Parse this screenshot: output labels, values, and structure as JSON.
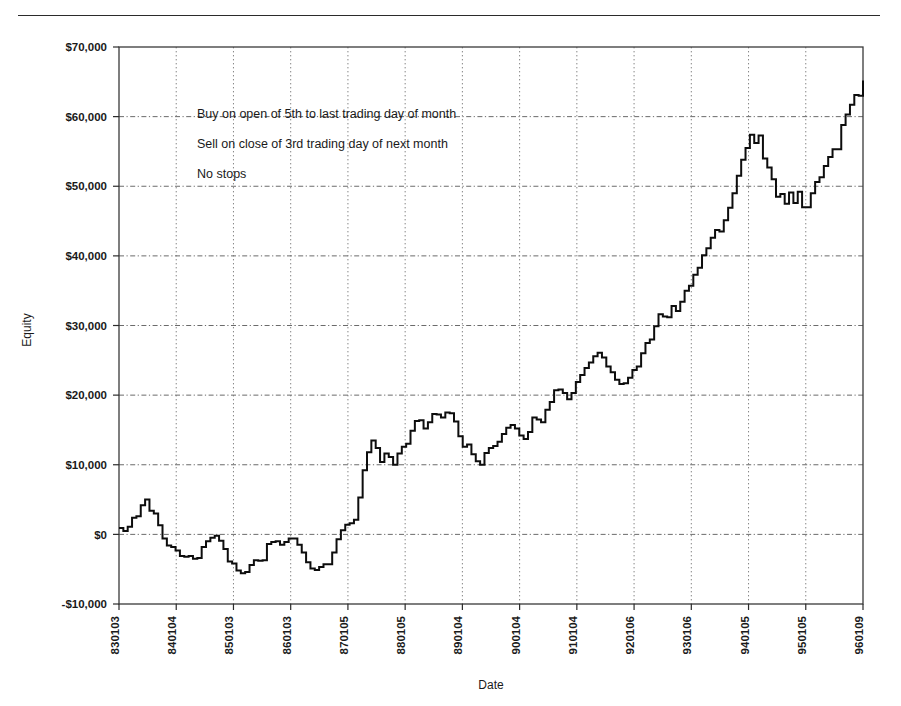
{
  "figure": {
    "kind": "equity-curve-chart"
  },
  "chart_data": {
    "type": "line",
    "title": "",
    "xlabel": "Date",
    "ylabel": "Equity",
    "grid": true,
    "legend": "none",
    "ylim": [
      -10000,
      70000
    ],
    "ytick_values": [
      70000,
      60000,
      50000,
      40000,
      30000,
      20000,
      10000,
      0,
      -10000
    ],
    "ytick_labels": [
      "$70,000",
      "$60,000",
      "$50,000",
      "$40,000",
      "$30,000",
      "$20,000",
      "$10,000",
      "$0",
      "-$10,000"
    ],
    "xtick_labels": [
      "830103",
      "840104",
      "850103",
      "860103",
      "870105",
      "880105",
      "890104",
      "900104",
      "910104",
      "920106",
      "930106",
      "940105",
      "950105",
      "960109"
    ],
    "xlim_labels": [
      "830103",
      "960109"
    ],
    "annotations": [
      "Buy on open of 5th to last trading day of month",
      "Sell on close of 3rd trading day of next month",
      "No stops"
    ],
    "series_name": "Equity",
    "line_color": "#0d0d0d",
    "step_style": "post",
    "x_index": [
      0,
      1,
      2,
      3,
      4,
      5,
      6,
      7,
      8,
      9,
      10,
      11,
      12,
      13,
      14,
      15,
      16,
      17,
      18,
      19,
      20,
      21,
      22,
      23,
      24,
      25,
      26,
      27,
      28,
      29,
      30,
      31,
      32,
      33,
      34,
      35,
      36,
      37,
      38,
      39,
      40,
      41,
      42,
      43,
      44,
      45,
      46,
      47,
      48,
      49,
      50,
      51,
      52,
      53,
      54,
      55,
      56,
      57,
      58,
      59,
      60,
      61,
      62,
      63,
      64,
      65,
      66,
      67,
      68,
      69,
      70,
      71,
      72,
      73,
      74,
      75,
      76,
      77,
      78,
      79,
      80,
      81,
      82,
      83,
      84,
      85,
      86,
      87,
      88,
      89,
      90,
      91,
      92,
      93,
      94,
      95,
      96,
      97,
      98,
      99,
      100,
      101,
      102,
      103,
      104,
      105,
      106,
      107,
      108,
      109,
      110,
      111,
      112,
      113,
      114,
      115,
      116,
      117,
      118,
      119,
      120,
      121,
      122,
      123,
      124,
      125,
      126,
      127,
      128,
      129,
      130,
      131,
      132,
      133,
      134,
      135,
      136,
      137,
      138,
      139,
      140,
      141,
      142,
      143,
      144,
      145,
      146,
      147,
      148,
      149,
      150,
      151,
      152,
      153,
      154,
      155,
      156
    ],
    "values": [
      900,
      500,
      1100,
      2400,
      2600,
      4200,
      5000,
      3400,
      3000,
      1300,
      -600,
      -1600,
      -1800,
      -2300,
      -3100,
      -3200,
      -3100,
      -3500,
      -3400,
      -1800,
      -1000,
      -500,
      -200,
      -900,
      -2100,
      -3900,
      -4200,
      -5200,
      -5600,
      -5400,
      -4400,
      -3700,
      -3800,
      -3700,
      -1400,
      -1100,
      -1000,
      -1500,
      -1100,
      -600,
      -600,
      -1500,
      -2600,
      -4000,
      -4900,
      -5100,
      -4700,
      -4300,
      -4300,
      -2600,
      -700,
      600,
      1400,
      1600,
      2100,
      5300,
      9200,
      11800,
      13500,
      12400,
      10400,
      11600,
      11100,
      10000,
      11600,
      12600,
      13000,
      14900,
      16300,
      16400,
      15200,
      16100,
      17300,
      17200,
      16800,
      17500,
      17400,
      16200,
      14100,
      12600,
      12900,
      11500,
      10500,
      10000,
      11700,
      12400,
      12700,
      13300,
      14400,
      15300,
      15700,
      15200,
      14200,
      13700,
      14700,
      16800,
      16500,
      16100,
      17900,
      19000,
      20700,
      20800,
      20300,
      19400,
      20300,
      21900,
      22900,
      23900,
      24700,
      25600,
      26100,
      25400,
      24100,
      23300,
      22200,
      21600,
      21700,
      22500,
      23600,
      24100,
      26000,
      27500,
      28000,
      29900,
      31600,
      31300,
      31200,
      32800,
      32100,
      33400,
      35000,
      35700,
      37300,
      38300,
      40100,
      41100,
      42600,
      43700,
      43500,
      45100,
      46900,
      49000,
      51500,
      53800,
      55500,
      57400,
      56200,
      57300,
      54000,
      52700,
      51000,
      48500,
      48900,
      47500,
      49100,
      47600,
      49200,
      47000,
      47000,
      49000,
      50600,
      51300,
      52900,
      54200,
      55300,
      55300,
      58800,
      60300,
      61700,
      63100,
      63000,
      65200
    ]
  },
  "plot_geometry": {
    "left": 119,
    "right": 863,
    "top": 47,
    "bottom": 604
  }
}
